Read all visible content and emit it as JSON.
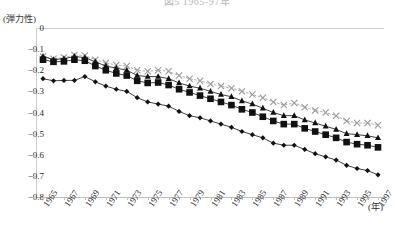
{
  "title": "図5  1965-97年",
  "y_axis_label": "(弾力性)",
  "x_axis_unit": "(年)",
  "y_ticks": [
    "0",
    "-0.1",
    "-0.2",
    "-0.3",
    "-0.4",
    "-0.5",
    "-0.6",
    "-0.7",
    "-0.8"
  ],
  "x_ticks": [
    "1965",
    "1967",
    "1969",
    "1971",
    "1973",
    "1975",
    "1977",
    "1979",
    "1981",
    "1983",
    "1985",
    "1987",
    "1989",
    "1991",
    "1993",
    "1995",
    "1997"
  ],
  "colors": {
    "series_cross": "#9a9a9a",
    "series_triangle": "#111111",
    "series_square": "#111111",
    "series_diamond": "#111111",
    "axis": "#c6c6c6",
    "text": "#2b2b2b"
  },
  "chart_data": {
    "type": "line",
    "title": "図5  1965-97年",
    "xlabel": "(年)",
    "ylabel": "(弾力性)",
    "xlim": [
      1965,
      1997
    ],
    "ylim": [
      -0.8,
      0
    ],
    "grid": false,
    "legend_position": "none",
    "x": [
      1965,
      1966,
      1967,
      1968,
      1969,
      1970,
      1971,
      1972,
      1973,
      1974,
      1975,
      1976,
      1977,
      1978,
      1979,
      1980,
      1981,
      1982,
      1983,
      1984,
      1985,
      1986,
      1987,
      1988,
      1989,
      1990,
      1991,
      1992,
      1993,
      1994,
      1995,
      1996,
      1997
    ],
    "series": [
      {
        "name": "series-cross",
        "marker": "x",
        "values": [
          -0.135,
          -0.145,
          -0.14,
          -0.128,
          -0.13,
          -0.15,
          -0.165,
          -0.175,
          -0.18,
          -0.2,
          -0.205,
          -0.2,
          -0.205,
          -0.225,
          -0.24,
          -0.25,
          -0.265,
          -0.275,
          -0.285,
          -0.3,
          -0.315,
          -0.33,
          -0.35,
          -0.365,
          -0.355,
          -0.375,
          -0.39,
          -0.4,
          -0.415,
          -0.44,
          -0.45,
          -0.45,
          -0.46
        ]
      },
      {
        "name": "series-triangle",
        "marker": "triangle",
        "values": [
          -0.135,
          -0.15,
          -0.145,
          -0.135,
          -0.14,
          -0.16,
          -0.18,
          -0.19,
          -0.2,
          -0.225,
          -0.23,
          -0.23,
          -0.24,
          -0.26,
          -0.275,
          -0.285,
          -0.3,
          -0.315,
          -0.325,
          -0.345,
          -0.36,
          -0.38,
          -0.4,
          -0.415,
          -0.415,
          -0.435,
          -0.45,
          -0.465,
          -0.48,
          -0.5,
          -0.505,
          -0.51,
          -0.52
        ]
      },
      {
        "name": "series-square",
        "marker": "square",
        "values": [
          -0.15,
          -0.16,
          -0.158,
          -0.15,
          -0.155,
          -0.18,
          -0.2,
          -0.215,
          -0.225,
          -0.25,
          -0.26,
          -0.258,
          -0.27,
          -0.29,
          -0.305,
          -0.32,
          -0.335,
          -0.35,
          -0.365,
          -0.385,
          -0.4,
          -0.42,
          -0.44,
          -0.455,
          -0.455,
          -0.475,
          -0.49,
          -0.505,
          -0.52,
          -0.54,
          -0.55,
          -0.555,
          -0.565
        ]
      },
      {
        "name": "series-diamond",
        "marker": "diamond",
        "values": [
          -0.24,
          -0.25,
          -0.248,
          -0.248,
          -0.23,
          -0.255,
          -0.275,
          -0.29,
          -0.3,
          -0.33,
          -0.35,
          -0.36,
          -0.37,
          -0.395,
          -0.415,
          -0.425,
          -0.44,
          -0.455,
          -0.47,
          -0.49,
          -0.505,
          -0.52,
          -0.545,
          -0.555,
          -0.555,
          -0.575,
          -0.595,
          -0.61,
          -0.625,
          -0.65,
          -0.665,
          -0.675,
          -0.695
        ]
      }
    ]
  }
}
